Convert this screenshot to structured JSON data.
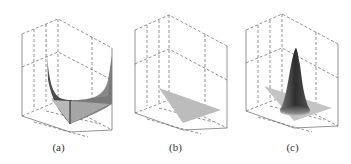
{
  "figure": {
    "panels": [
      {
        "id": "a",
        "caption": "(a)",
        "description": "3D surface plot with steep walls rising along edges, valley-shaped surface"
      },
      {
        "id": "b",
        "caption": "(b)",
        "description": "3D plot with flat triangular surface on the base plane"
      },
      {
        "id": "c",
        "caption": "(c)",
        "description": "3D surface plot with a single tall sharp peak on a triangular base"
      }
    ]
  },
  "colors": {
    "axis_lines": "#555555",
    "surface_light": "#bdbdbd",
    "surface_dark": "#2a2a2a",
    "background": "#ffffff"
  }
}
